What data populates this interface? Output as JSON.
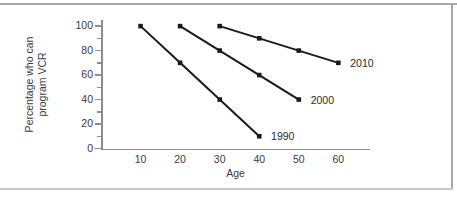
{
  "chart_data": {
    "type": "line",
    "title": "",
    "xlabel": "Age",
    "ylabel": "Percentage who can\nprogram VCR",
    "xlim": [
      0,
      68
    ],
    "ylim": [
      0,
      105
    ],
    "xticks": [
      10,
      20,
      30,
      40,
      50,
      60
    ],
    "yticks": [
      0,
      20,
      40,
      60,
      80,
      100
    ],
    "yticks_minor": [
      10,
      30,
      50,
      70,
      90
    ],
    "grid": false,
    "legend_position": "inline-end-of-line",
    "marker": "square",
    "line_color": "#1a1a1a",
    "series": [
      {
        "name": "1990",
        "x": [
          10,
          20,
          30,
          40
        ],
        "values": [
          100,
          70,
          40,
          10
        ],
        "label_x": 43,
        "label_y": 10
      },
      {
        "name": "2000",
        "x": [
          20,
          30,
          40,
          50
        ],
        "values": [
          100,
          80,
          60,
          40
        ],
        "label_x": 53,
        "label_y": 40
      },
      {
        "name": "2010",
        "x": [
          30,
          40,
          50,
          60
        ],
        "values": [
          100,
          90,
          80,
          70
        ],
        "label_x": 63,
        "label_y": 70
      }
    ]
  },
  "figure": {
    "axis_color": "#8d8d8d",
    "frame_color": "#a8a8a8",
    "background": "#ffffff"
  }
}
